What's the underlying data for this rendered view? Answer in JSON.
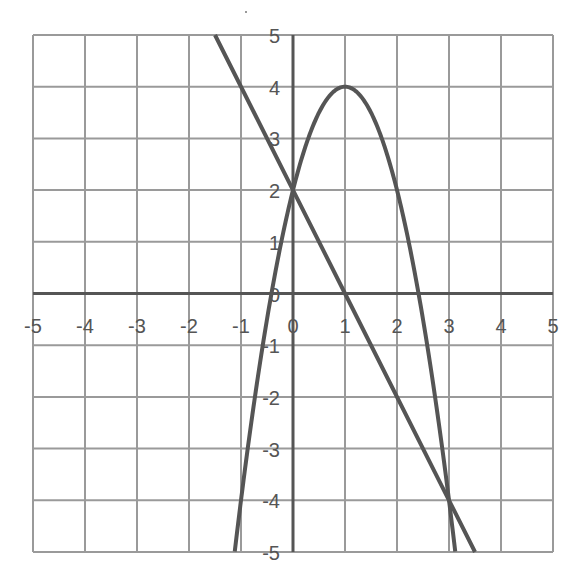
{
  "chart_data": {
    "type": "line",
    "title": "",
    "xlabel": "",
    "ylabel": "",
    "xlim": [
      -5,
      5
    ],
    "ylim": [
      -5,
      5
    ],
    "grid": true,
    "legend": null,
    "x_ticks": [
      -5,
      -4,
      -3,
      -2,
      -1,
      0,
      1,
      2,
      3,
      4,
      5
    ],
    "y_ticks": [
      5,
      4,
      3,
      2,
      1,
      0,
      -1,
      -2,
      -3,
      -4,
      -5
    ],
    "series": [
      {
        "name": "parabola",
        "equation": "y = -2x^2 + 4x + 2",
        "coeffs": [
          -2,
          4,
          2
        ],
        "x": [
          -1.12,
          -1,
          -0.5,
          0,
          0.5,
          1,
          1.5,
          2,
          2.5,
          3,
          3.12
        ],
        "y": [
          -5,
          -4,
          -0.5,
          2,
          3.5,
          4,
          3.5,
          2,
          -0.5,
          -4,
          -5
        ]
      },
      {
        "name": "line",
        "equation": "y = -2x + 2",
        "coeffs": [
          -2,
          2
        ],
        "x": [
          -1.5,
          0,
          1,
          3,
          3.5
        ],
        "y": [
          5,
          2,
          0,
          -4,
          -5
        ]
      }
    ],
    "annotations": {
      "intersections": [
        [
          0,
          2
        ],
        [
          3,
          -4
        ]
      ],
      "vertex": [
        1,
        4
      ]
    }
  },
  "style": {
    "grid_color": "#9a9a9a",
    "axis_color": "#555555",
    "curve_color": "#555555",
    "label_color": "#555555"
  }
}
